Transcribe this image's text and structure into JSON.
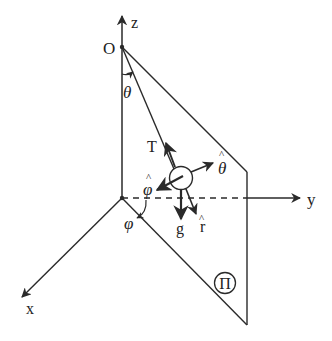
{
  "diagram": {
    "stroke_color": "#2a2a2a",
    "background": "#ffffff",
    "axes": {
      "z_label": "z",
      "y_label": "y",
      "x_label": "x",
      "origin_label": "O"
    },
    "angles": {
      "theta": "θ",
      "phi": "φ"
    },
    "vectors": {
      "tension": "T",
      "gravity": "g",
      "r_hat": "r",
      "theta_hat": "θ",
      "phi_hat": "φ",
      "hat_mark": "^"
    },
    "plane_label": "Π"
  }
}
